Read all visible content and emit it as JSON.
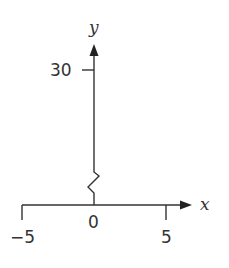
{
  "figure": {
    "type": "coordinate-axes",
    "axis_break": "y-axis",
    "colors": {
      "stroke": "#333333",
      "background": "#ffffff"
    }
  },
  "axes": {
    "x_label": "x",
    "y_label": "y",
    "x_ticks": [
      {
        "value": -5,
        "label": "−5"
      },
      {
        "value": 0,
        "label": "0"
      },
      {
        "value": 5,
        "label": "5"
      }
    ],
    "y_ticks": [
      {
        "value": 30,
        "label": "30"
      }
    ]
  }
}
